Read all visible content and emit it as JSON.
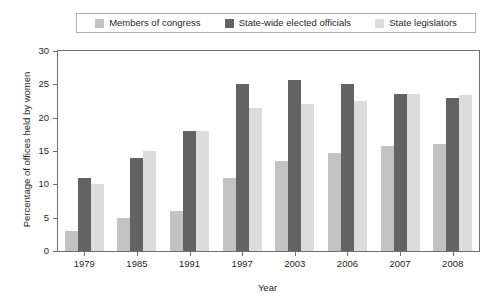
{
  "chart_data": {
    "type": "bar",
    "title": "",
    "xlabel": "Year",
    "ylabel": "Percentage of offices held by women",
    "categories": [
      "1979",
      "1985",
      "1991",
      "1997",
      "2003",
      "2006",
      "2007",
      "2008"
    ],
    "series": [
      {
        "name": "Members of congress",
        "color": "#c2c2c2",
        "values": [
          3,
          5,
          6,
          11,
          13.5,
          14.7,
          15.8,
          16
        ]
      },
      {
        "name": "State-wide elected officials",
        "color": "#636363",
        "values": [
          11,
          14,
          18,
          25.1,
          25.7,
          25,
          23.5,
          23
        ]
      },
      {
        "name": "State legislators",
        "color": "#dcdcdc",
        "values": [
          10,
          15,
          18,
          21.5,
          22,
          22.5,
          23.5,
          23.4
        ]
      }
    ],
    "ylim": [
      0,
      30
    ],
    "yticks": [
      "0",
      "5",
      "10",
      "15",
      "20",
      "25",
      "30"
    ],
    "grid": false,
    "legend_position": "top"
  },
  "legend": {
    "items": [
      {
        "label": "Members of congress",
        "color": "#c2c2c2"
      },
      {
        "label": "State-wide elected officials",
        "color": "#636363"
      },
      {
        "label": "State legislators",
        "color": "#dcdcdc"
      }
    ]
  }
}
